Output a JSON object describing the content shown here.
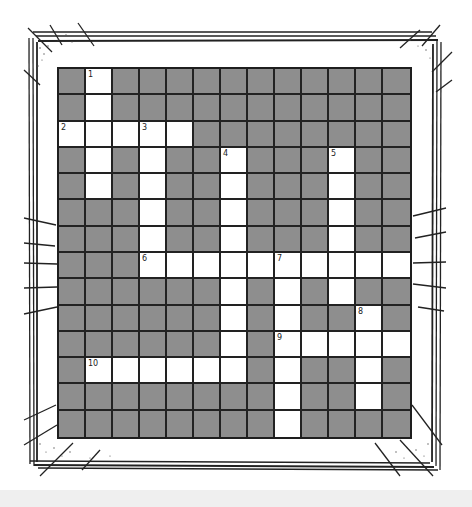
{
  "puzzle": {
    "rows": 14,
    "cols": 13,
    "colors": {
      "blocked": "#8e8e8e",
      "open": "#ffffff",
      "grid_line": "#1e1e1e"
    },
    "grid": [
      "0100000000000",
      "0100000000000",
      "1111100000000",
      "0101001000100",
      "0101001000100",
      "0001001000100",
      "0001001000100",
      "0001111111111",
      "0000001010100",
      "0000001010010",
      "0000001011111",
      "0111111010010",
      "0000000010010",
      "0000000010000"
    ],
    "clue_numbers": [
      {
        "row": 0,
        "col": 1,
        "label": "1"
      },
      {
        "row": 2,
        "col": 0,
        "label": "2"
      },
      {
        "row": 2,
        "col": 3,
        "label": "3"
      },
      {
        "row": 3,
        "col": 6,
        "label": "4"
      },
      {
        "row": 3,
        "col": 10,
        "label": "5"
      },
      {
        "row": 7,
        "col": 3,
        "label": "6"
      },
      {
        "row": 7,
        "col": 8,
        "label": "7"
      },
      {
        "row": 9,
        "col": 11,
        "label": "8"
      },
      {
        "row": 10,
        "col": 8,
        "label": "9"
      },
      {
        "row": 11,
        "col": 1,
        "label": "10"
      }
    ]
  }
}
